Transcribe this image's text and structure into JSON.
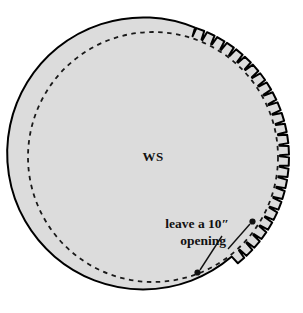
{
  "diagram": {
    "type": "sewing-pattern-illustration",
    "labels": {
      "wrong_side": "WS",
      "opening_line1": "leave a 10″",
      "opening_line2": "opening"
    },
    "colors": {
      "fabric_fill": "#dcdcdc",
      "outline": "#000000",
      "stitch_line": "#1a1a1a",
      "background": "#ffffff",
      "text": "#111111"
    },
    "geometry": {
      "center_x": 153,
      "center_y": 157,
      "outer_radius": 136,
      "stitch_radius": 125,
      "notch_depth": 9,
      "notch_count": 26,
      "notch_start_deg": -72,
      "notch_end_deg": 52
    },
    "annotations": [
      {
        "name": "opening-arrow-lower-left",
        "from_x": 222,
        "from_y": 236,
        "to_x": 198,
        "to_y": 272,
        "tip": "dot"
      },
      {
        "name": "opening-arrow-right",
        "from_x": 228,
        "from_y": 248,
        "to_x": 252,
        "to_y": 222,
        "tip": "dot"
      }
    ]
  }
}
